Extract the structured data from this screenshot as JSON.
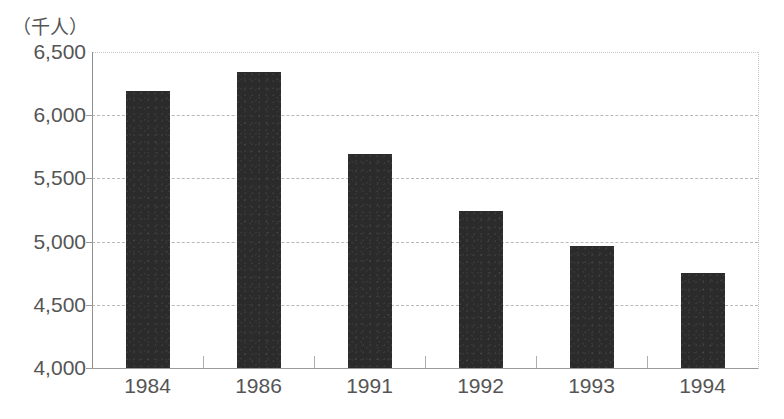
{
  "chart_data": {
    "type": "bar",
    "title": "",
    "subtitle": "",
    "unit_label": "（千人）",
    "xlabel": "",
    "ylabel": "",
    "categories": [
      "1984",
      "1986",
      "1991",
      "1992",
      "1993",
      "1994"
    ],
    "values": [
      6190,
      6340,
      5690,
      5240,
      4965,
      4750
    ],
    "ylim": [
      4000,
      6500
    ],
    "ytick_step": 500,
    "ytick_labels": [
      "6,500",
      "6,000",
      "5,500",
      "5,000",
      "4,500",
      "4,000"
    ],
    "ytick_values": [
      6500,
      6000,
      5500,
      5000,
      4500,
      4000
    ],
    "grid": true,
    "legend": "none",
    "bar_color": "#2b2b2b",
    "grid_color": "#b9b9b9",
    "axis_color": "#8f8f8f",
    "text_color": "#555555",
    "background_color": "#ffffff"
  }
}
